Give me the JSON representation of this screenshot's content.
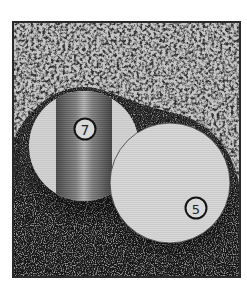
{
  "illustration": {
    "subject": "Two billiard balls on a textured surface",
    "colors": {
      "page": "#ffffff",
      "frame": "#2a2a2a",
      "upper_texture_light": "#c9c9c9",
      "upper_texture_dark": "#3a3a3a",
      "lower_texture_dark": "#141414",
      "lower_texture_light": "#8a8a8a",
      "ball_face": "#d6d6d6",
      "stripe": "#8c8c8c",
      "number_ring": "#1a1a1a"
    },
    "balls": [
      {
        "label": "7",
        "type": "striped"
      },
      {
        "label": "5",
        "type": "solid"
      }
    ]
  }
}
